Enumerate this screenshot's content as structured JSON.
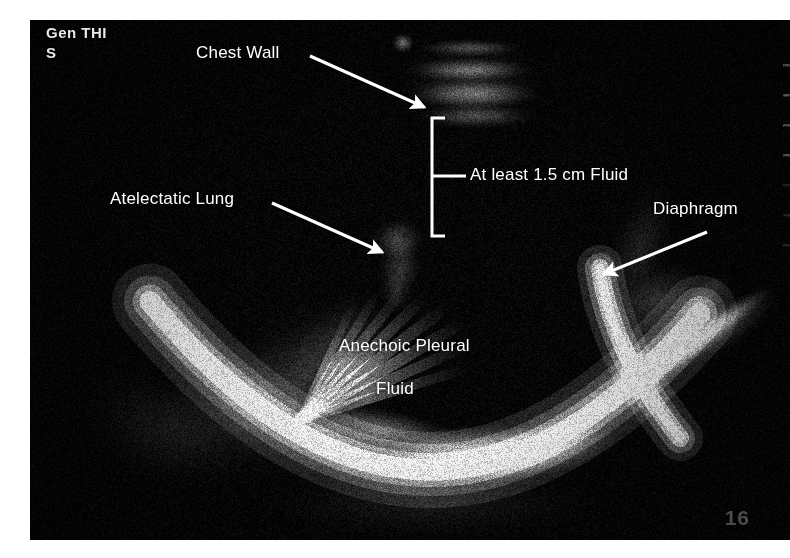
{
  "figure": {
    "kind": "ultrasound-image",
    "modality": "thoracic ultrasound"
  },
  "osd": {
    "mode_label": "Gen THI",
    "sector_label": "S",
    "depth_label": "16"
  },
  "annotations": {
    "chest_wall": {
      "label": "Chest Wall",
      "arrow": {
        "x1": 310,
        "y1": 56,
        "x2": 424,
        "y2": 107
      }
    },
    "atelectatic_lung": {
      "label": "Atelectatic Lung",
      "arrow": {
        "x1": 272,
        "y1": 203,
        "x2": 382,
        "y2": 252
      }
    },
    "fluid_measure": {
      "label": "At least 1.5 cm Fluid",
      "bracket": {
        "x": 432,
        "y_top": 118,
        "y_bottom": 236,
        "tick_y": 176,
        "tick_x2": 466
      }
    },
    "diaphragm": {
      "label": "Diaphragm",
      "arrow": {
        "x1": 707,
        "y1": 232,
        "x2": 604,
        "y2": 274
      }
    },
    "anechoic_fluid": {
      "label_line1": "Anechoic Pleural",
      "label_line2": "Fluid"
    }
  },
  "colors": {
    "page_background": "#ffffff",
    "image_background": "#050505",
    "annotation_text": "#ffffff",
    "osd_text": "#e8e8e8",
    "depth_text": "#4a4a4a",
    "bright_tissue": "#f2f2f2"
  },
  "frame": {
    "left": 30,
    "top": 20,
    "width": 760,
    "height": 520
  }
}
